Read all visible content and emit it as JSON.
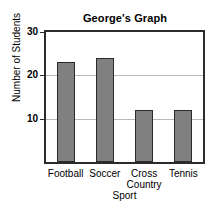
{
  "chart_data": {
    "type": "bar",
    "title": "George's Graph",
    "xlabel": "Sport",
    "ylabel": "Number of Students",
    "categories": [
      "Football",
      "Soccer",
      "Cross Country",
      "Tennis"
    ],
    "values": [
      23,
      24,
      12,
      12
    ],
    "ylim": [
      0,
      30
    ],
    "yticks": [
      10,
      20,
      30
    ],
    "ytick_labels": [
      "10",
      "20",
      "30"
    ],
    "grid": true,
    "legend": false,
    "bar_color": "#808080",
    "bar_edge_color": "#2b2b2b",
    "gridline_color": "#b9b9b9",
    "axis_color": "#2b2b2b"
  }
}
